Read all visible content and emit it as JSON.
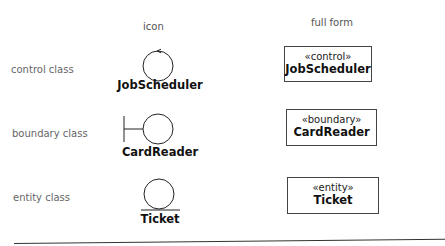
{
  "headers": {
    "icon": "icon",
    "full_form": "full form"
  },
  "rows": [
    {
      "label": "control class",
      "icon_type": "control-icon",
      "icon_name": "JobScheduler",
      "stereotype": "«control»",
      "full_name": "JobScheduler"
    },
    {
      "label": "boundary class",
      "icon_type": "boundary-icon",
      "icon_name": "CardReader",
      "stereotype": "«boundary»",
      "full_name": "CardReader"
    },
    {
      "label": "entity class",
      "icon_type": "entity-icon",
      "icon_name": "Ticket",
      "stereotype": "«entity»",
      "full_name": "Ticket"
    }
  ]
}
